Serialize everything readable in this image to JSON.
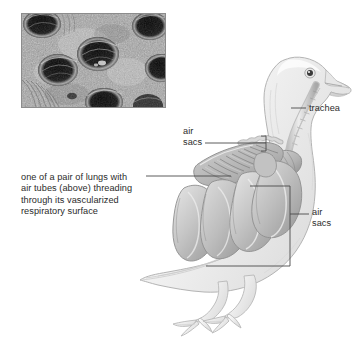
{
  "figure": {
    "background_color": "#ffffff",
    "text_color": "#2b2b2b",
    "line_color": "#4a4a4a"
  },
  "micrograph": {
    "name": "scanning electron micrograph of bird lung air tubes",
    "border_color": "#8c8c8c",
    "description": "grayscale micrograph showing dark circular openings of parabronchi in vascularized lung tissue"
  },
  "labels": {
    "lungs": "one of a pair of lungs with\nair tubes (above) threading\nthrough its vascularized\nrespiratory surface",
    "air_sacs_upper": "air\nsacs",
    "trachea": "trachea",
    "air_sacs_right": "air\nsacs"
  },
  "diagram": {
    "body_fill": "#f2f2f2",
    "organ_fill": "#c8c8c8",
    "outline_color": "#9e9e9e",
    "parts": [
      "head",
      "beak",
      "eye",
      "trachea",
      "syrinx",
      "lung",
      "anterior air sacs",
      "posterior air sacs",
      "legs",
      "feet",
      "tail"
    ]
  }
}
